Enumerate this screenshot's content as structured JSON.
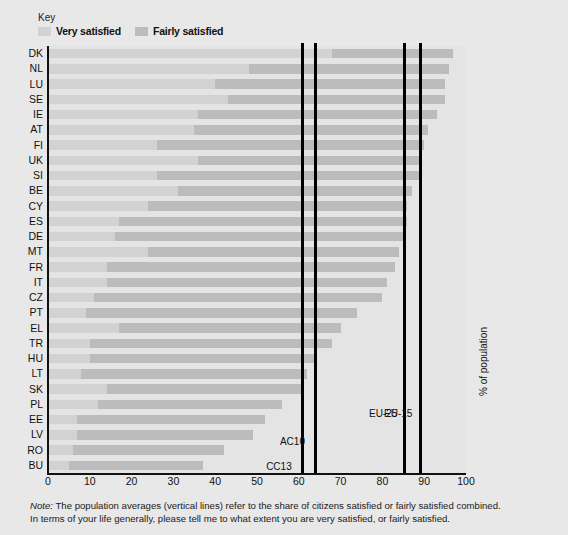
{
  "legend": {
    "title": "Key",
    "entries": [
      {
        "label": "Very satisfied",
        "color": "#d2d2d2"
      },
      {
        "label": "Fairly satisfied",
        "color": "#bcbcbc"
      }
    ]
  },
  "axis": {
    "ylabel": "% of population",
    "xticks": [
      "0",
      "10",
      "20",
      "30",
      "40",
      "50",
      "60",
      "70",
      "80",
      "90",
      "100"
    ]
  },
  "note": {
    "prefix": "Note:",
    "line1": " The population averages (vertical lines) refer to the share of citizens satisfied or fairly satisfied combined.",
    "line2": "In terms of your life generally, please tell me to what extent you are very satisfied, or fairly satisfied."
  },
  "reference_lines": [
    {
      "label": "CC13",
      "value": 60.8,
      "label_y": 415
    },
    {
      "label": "AC10",
      "value": 64.1,
      "label_y": 390
    },
    {
      "label": "EU-25",
      "value": 85.4,
      "label_y": 362
    },
    {
      "label": "EU-15",
      "value": 89.0,
      "label_y": 362
    }
  ],
  "chart_data": {
    "type": "bar",
    "orientation": "horizontal",
    "stacked": true,
    "title": "",
    "xlabel": "% of population",
    "ylabel": "",
    "xlim": [
      0,
      100
    ],
    "grid": false,
    "legend_position": "top-left",
    "categories": [
      "DK",
      "NL",
      "LU",
      "SE",
      "IE",
      "AT",
      "FI",
      "UK",
      "SI",
      "BE",
      "CY",
      "ES",
      "DE",
      "MT",
      "FR",
      "IT",
      "CZ",
      "PT",
      "EL",
      "TR",
      "HU",
      "LT",
      "SK",
      "PL",
      "EE",
      "LV",
      "RO",
      "BU"
    ],
    "series": [
      {
        "name": "Very satisfied",
        "color": "#d2d2d2",
        "values": [
          68,
          48,
          40,
          43,
          36,
          35,
          26,
          36,
          26,
          31,
          24,
          17,
          16,
          24,
          14,
          14,
          11,
          9,
          17,
          10,
          10,
          8,
          14,
          12,
          7,
          7,
          6,
          5
        ]
      },
      {
        "name": "Fairly satisfied",
        "color": "#bcbcbc",
        "values": [
          29,
          48,
          55,
          52,
          57,
          56,
          64,
          53,
          63,
          56,
          62,
          69,
          69,
          60,
          69,
          67,
          69,
          65,
          53,
          58,
          54,
          54,
          47,
          44,
          45,
          42,
          36,
          32
        ]
      }
    ],
    "totals": [
      97,
      96,
      95,
      95,
      93,
      91,
      90,
      89,
      89,
      87,
      86,
      86,
      85,
      84,
      83,
      81,
      80,
      74,
      70,
      68,
      64,
      62,
      61,
      56,
      52,
      49,
      42,
      37
    ]
  }
}
